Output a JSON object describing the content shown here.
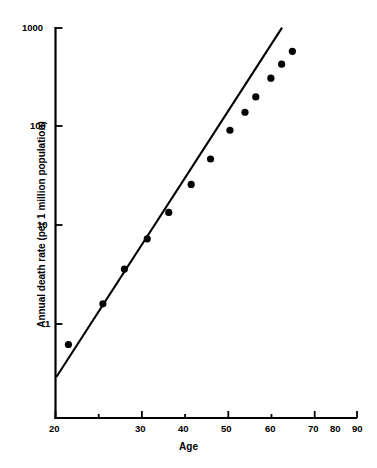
{
  "figure": {
    "background": "#ffffff",
    "ink_color": "#000000"
  },
  "axes": {
    "x_title": "Age",
    "y_title": "Annual death rate (per 1 million population)",
    "x_ticks": [
      "20",
      "30",
      "40",
      "50",
      "60",
      "70",
      "80",
      "90"
    ],
    "y_ticks": [
      "1",
      "10",
      "100",
      "1000"
    ]
  },
  "chart_data": {
    "type": "scatter",
    "title": "",
    "xlabel": "Age",
    "ylabel": "Annual death rate (per 1 million population)",
    "xlim": [
      20,
      90
    ],
    "ylim": [
      0.2,
      1000
    ],
    "yscale": "log",
    "xscale": "linear",
    "grid": false,
    "legend": null,
    "x_tick_values": [
      20,
      30,
      40,
      50,
      60,
      70,
      80,
      90
    ],
    "y_tick_values": [
      1,
      10,
      100,
      1000
    ],
    "series": [
      {
        "name": "Annual death rate",
        "type": "scatter",
        "marker": "filled-circle",
        "color": "#000000",
        "points": [
          {
            "x": 23.0,
            "y": 0.62
          },
          {
            "x": 31.0,
            "y": 1.6
          },
          {
            "x": 36.0,
            "y": 3.6
          },
          {
            "x": 41.3,
            "y": 7.3
          },
          {
            "x": 46.3,
            "y": 13.5
          },
          {
            "x": 51.5,
            "y": 26
          },
          {
            "x": 56.0,
            "y": 47
          },
          {
            "x": 60.5,
            "y": 92
          },
          {
            "x": 64.0,
            "y": 140
          },
          {
            "x": 66.5,
            "y": 200
          },
          {
            "x": 70.0,
            "y": 310
          },
          {
            "x": 72.5,
            "y": 430
          },
          {
            "x": 75.0,
            "y": 580
          }
        ]
      },
      {
        "name": "Fitted line",
        "type": "line",
        "color": "#000000",
        "endpoints": [
          {
            "x": 20.2,
            "y": 0.29
          },
          {
            "x": 72.6,
            "y": 1010
          }
        ]
      }
    ]
  }
}
